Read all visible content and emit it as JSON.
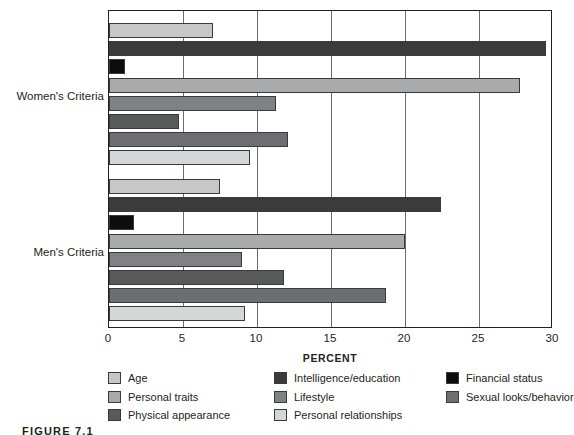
{
  "chart_data": {
    "type": "bar",
    "orientation": "horizontal",
    "title": "",
    "xlabel": "PERCENT",
    "ylabel": "",
    "xlim": [
      0,
      30
    ],
    "xticks": [
      0,
      5,
      10,
      15,
      20,
      25,
      30
    ],
    "xtick_labels": [
      "0",
      "5",
      "10",
      "15",
      "20",
      "25",
      "30"
    ],
    "grid": true,
    "grid_axis": "x",
    "legend_position": "bottom",
    "categories": [
      "Women's Criteria",
      "Men's Criteria"
    ],
    "series": [
      {
        "name": "Age",
        "color": "#c6c7c9",
        "values": [
          7.0,
          7.5
        ]
      },
      {
        "name": "Intelligence/education",
        "color": "#3b3b3d",
        "values": [
          29.5,
          22.4
        ]
      },
      {
        "name": "Financial status",
        "color": "#0d0d0d",
        "values": [
          1.1,
          1.7
        ]
      },
      {
        "name": "Personal traits",
        "color": "#a9aaac",
        "values": [
          27.8,
          20.0
        ]
      },
      {
        "name": "Lifestyle",
        "color": "#808184",
        "values": [
          11.3,
          9.0
        ]
      },
      {
        "name": "Physical appearance",
        "color": "#58595b",
        "values": [
          4.7,
          11.8
        ]
      },
      {
        "name": "Sexual looks/behavior",
        "color": "#6d6e71",
        "values": [
          12.1,
          18.7
        ]
      },
      {
        "name": "Personal relationships",
        "color": "#d5d6d8",
        "values": [
          9.5,
          9.2
        ]
      }
    ],
    "legend_columns": [
      [
        "Age",
        "Personal traits",
        "Physical appearance"
      ],
      [
        "Intelligence/education",
        "Lifestyle",
        "Personal relationships"
      ],
      [
        "Financial status",
        "Sexual looks/behavior"
      ]
    ]
  },
  "axis": {
    "x_title": "PERCENT"
  },
  "caption": {
    "figure_number": "FIGURE 7.1",
    "text": "FIGURE 7.1"
  }
}
